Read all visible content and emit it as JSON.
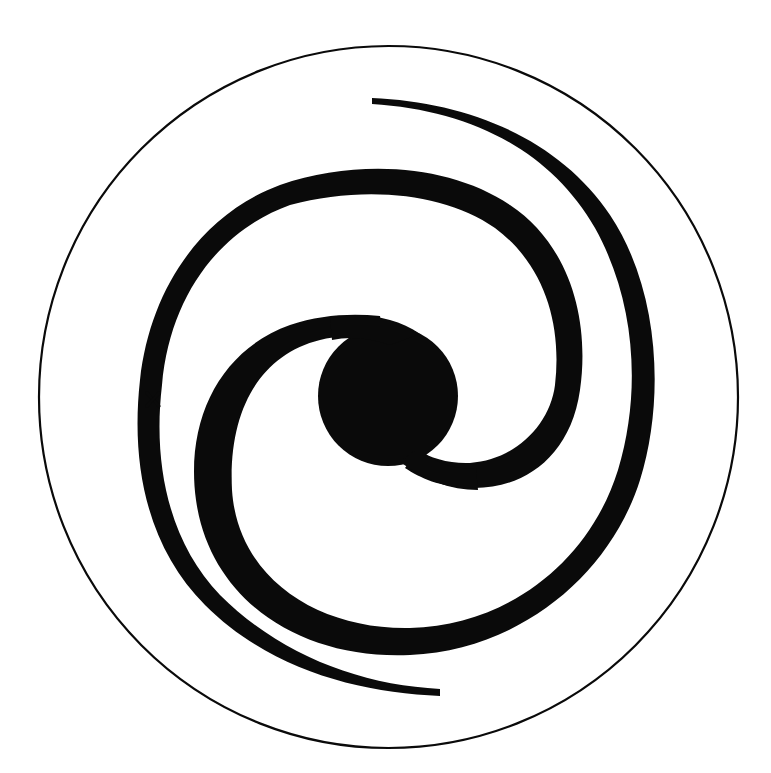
{
  "diagram": {
    "colors": {
      "ink": "#0a0a0a",
      "background": "#ffffff"
    },
    "components": [
      {
        "id": "boundary",
        "label": "outer boundary circle"
      },
      {
        "id": "nucleus",
        "label": "galactic nucleus"
      },
      {
        "id": "arm-a",
        "label": "spiral arm A"
      },
      {
        "id": "arm-b",
        "label": "spiral arm B"
      },
      {
        "id": "marker",
        "label": "position marker",
        "symbol": "×"
      }
    ]
  }
}
